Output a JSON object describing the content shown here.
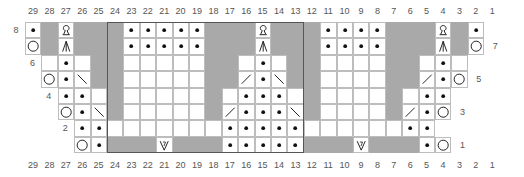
{
  "chart": {
    "title": "",
    "columns": [
      29,
      28,
      27,
      26,
      25,
      24,
      23,
      22,
      21,
      20,
      19,
      18,
      17,
      16,
      15,
      14,
      13,
      12,
      11,
      10,
      9,
      8,
      7,
      6,
      5,
      4,
      3,
      2,
      1
    ],
    "row_labels": {
      "left": [
        {
          "row": 8,
          "label": "8"
        },
        {
          "row": 6,
          "label": "6"
        },
        {
          "row": 4,
          "label": "4"
        },
        {
          "row": 2,
          "label": "2"
        }
      ],
      "right": [
        {
          "row": 7,
          "label": "7"
        },
        {
          "row": 5,
          "label": "5"
        },
        {
          "row": 3,
          "label": "3"
        },
        {
          "row": 1,
          "label": "1"
        }
      ]
    },
    "legend_codes": {
      "W": "knit (empty white)",
      "G": "no stitch (gray)",
      "P": "purl (dot)",
      "O": "yarn over (circle)",
      "Q": "loop / make stitch",
      "A": "central double decrease",
      "L": "right-slant decrease (\\)",
      "R": "left-slant decrease (/)",
      "V": "special stitch V with 7",
      "X": "outside chart"
    },
    "rows": [
      {
        "row": 8,
        "cells": "P G Q G G G P P P P P G G G Q G G G P P P P G G G Q G P X"
      },
      {
        "row": 7,
        "cells": "O G A G G G P P P P P G G G A G G G P P P P G G G A G O X"
      },
      {
        "row": 6,
        "cells": "X W P W G G W W W W W G G W P W G G W W W W G G W P W X X"
      },
      {
        "row": 5,
        "cells": "X O P L G G W W W W W G G R P L G G W W W W G G R P O X X"
      },
      {
        "row": 4,
        "cells": "X X P P W G W W W W W G W P P P W G W W W W G W P P X X X"
      },
      {
        "row": 3,
        "cells": "X X O P L G W W W W W G R P P P L G W W W W G R P O X X X"
      },
      {
        "row": 2,
        "cells": "X X X P P W W W W W W W P P P P P W W W W W W P P X X X X"
      },
      {
        "row": 1,
        "cells": "X X X O P G G G V G G G P P P P P G G G V G G G P O X X X"
      }
    ],
    "bold_frame": {
      "from_col": 24,
      "to_col": 13,
      "from_row": 8,
      "to_row": 1
    }
  },
  "colors": {
    "gray": "#a9a9a9",
    "grid_line": "#bdbdbd",
    "frame": "#555555",
    "text": "#555555"
  }
}
